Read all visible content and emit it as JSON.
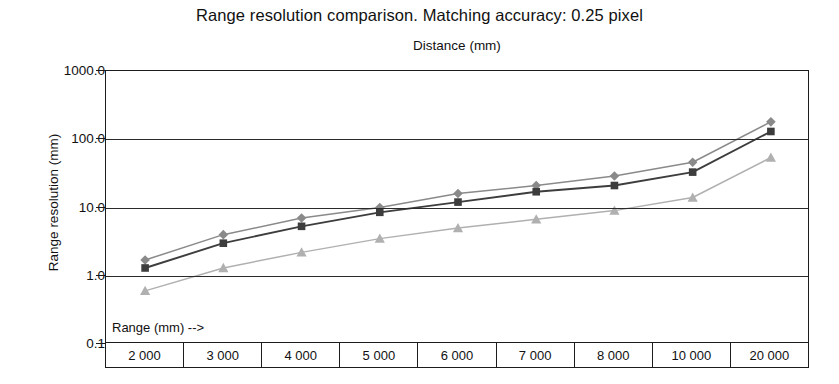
{
  "chart_data": {
    "type": "line",
    "title": "Range resolution comparison. Matching accuracy: 0.25 pixel",
    "subtitle": "Distance (mm)",
    "xlabel": "Range (mm) -->",
    "ylabel": "Range resolution (mm)",
    "x_axis_top_label": "Distance (mm)",
    "categories": [
      "2 000",
      "3 000",
      "4 000",
      "5 000",
      "6 000",
      "7 000",
      "8 000",
      "10 000",
      "20 000"
    ],
    "x_values": [
      2000,
      3000,
      4000,
      5000,
      6000,
      7000,
      8000,
      10000,
      20000
    ],
    "yscale": "log",
    "ylim": [
      0.1,
      1000.0
    ],
    "y_ticks": [
      "1000.0",
      "100.0",
      "10.0",
      "1.0",
      "0.1"
    ],
    "y_tick_values": [
      1000.0,
      100.0,
      10.0,
      1.0,
      0.1
    ],
    "grid": true,
    "legend": "none",
    "series": [
      {
        "name": "series-diamond",
        "marker": "diamond",
        "color": "#8a8a8a",
        "values": [
          1.7,
          4.0,
          7.0,
          10.0,
          16.0,
          21.0,
          29.0,
          46.0,
          180.0
        ]
      },
      {
        "name": "series-square",
        "marker": "square",
        "color": "#3d3d3d",
        "values": [
          1.3,
          3.0,
          5.3,
          8.5,
          12.0,
          17.0,
          21.0,
          33.0,
          130.0
        ]
      },
      {
        "name": "series-triangle",
        "marker": "triangle",
        "color": "#b0b0b0",
        "values": [
          0.6,
          1.3,
          2.2,
          3.5,
          5.0,
          6.7,
          9.0,
          14.0,
          54.0
        ]
      }
    ]
  },
  "colors": {
    "axis": "#1c1c1c",
    "grid": "#2a2a2a",
    "background": "#ffffff",
    "text": "#111111"
  }
}
